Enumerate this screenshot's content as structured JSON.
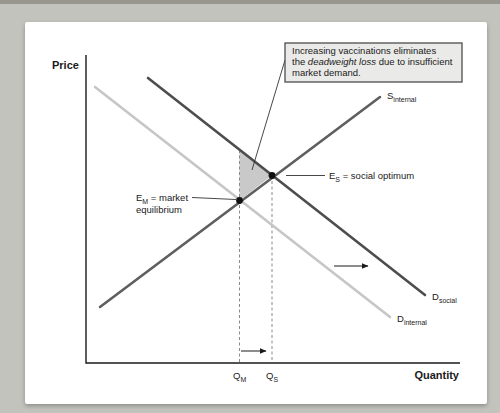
{
  "figure": {
    "axes": {
      "y_label": "Price",
      "x_label": "Quantity"
    },
    "annotation": {
      "line1": "Increasing vaccinations eliminates",
      "line2_pre": "the ",
      "line2_italic": "deadweight loss",
      "line2_post": " due to insufficient",
      "line3": "market demand."
    },
    "curves": {
      "supply_internal": {
        "symbol": "S",
        "subscript": "internal",
        "color": "#5f5f5f"
      },
      "demand_social": {
        "symbol": "D",
        "subscript": "social",
        "color": "#4d4d4d"
      },
      "demand_internal": {
        "symbol": "D",
        "subscript": "internal",
        "color": "#c6c6c6",
        "label_color": "#9a9a9a"
      }
    },
    "points": {
      "market_equilibrium": {
        "symbol": "E",
        "subscript": "M",
        "desc": " = market",
        "desc_line2": "equilibrium"
      },
      "social_optimum": {
        "symbol": "E",
        "subscript": "S",
        "desc": " = social optimum"
      }
    },
    "quantity_ticks": {
      "qm": {
        "symbol": "Q",
        "subscript": "M"
      },
      "qs": {
        "symbol": "Q",
        "subscript": "S"
      }
    },
    "colors": {
      "surround": "#c3c3be",
      "page": "#ffffff",
      "axis": "#1a1a1a",
      "deadweight_fill": "#c9c9c9",
      "annotation_bg": "#eaeae8",
      "annotation_border": "#4d4d4d",
      "dashed": "#8a8a8a"
    }
  }
}
